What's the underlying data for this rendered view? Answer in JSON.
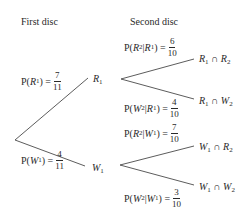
{
  "headers": {
    "first": "First disc",
    "second": "Second disc"
  },
  "first_stage": {
    "r1": {
      "node_label": "R",
      "node_sub": "1",
      "prob_prefix": "P(",
      "prob_event": "R",
      "prob_sub": "1",
      "prob_suffix": ") =",
      "num": "7",
      "den": "11"
    },
    "w1": {
      "node_label": "W",
      "node_sub": "1",
      "prob_prefix": "P(",
      "prob_event": "W",
      "prob_sub": "1",
      "prob_suffix": ") =",
      "num": "4",
      "den": "11"
    }
  },
  "second_stage": {
    "r2_given_r1": {
      "prob_text_a": "P(",
      "ev_a": "R",
      "sub_a": "2",
      "bar": " | ",
      "ev_b": "R",
      "sub_b": "1",
      "prob_text_b": ") =",
      "num": "6",
      "den": "10",
      "outcome_a": "R",
      "outcome_a_sub": "1",
      "cap": " ∩ ",
      "outcome_b": "R",
      "outcome_b_sub": "2"
    },
    "w2_given_r1": {
      "prob_text_a": "P(",
      "ev_a": "W",
      "sub_a": "2",
      "bar": " | ",
      "ev_b": "R",
      "sub_b": "1",
      "prob_text_b": ") =",
      "num": "4",
      "den": "10",
      "outcome_a": "R",
      "outcome_a_sub": "1",
      "cap": " ∩ ",
      "outcome_b": "W",
      "outcome_b_sub": "2"
    },
    "r2_given_w1": {
      "prob_text_a": "P(",
      "ev_a": "R",
      "sub_a": "2",
      "bar": " | ",
      "ev_b": "W",
      "sub_b": "1",
      "prob_text_b": ") =",
      "num": "7",
      "den": "10",
      "outcome_a": "W",
      "outcome_a_sub": "1",
      "cap": " ∩ ",
      "outcome_b": "R",
      "outcome_b_sub": "2"
    },
    "w2_given_w1": {
      "prob_text_a": "P(",
      "ev_a": "W",
      "sub_a": "2",
      "bar": " | ",
      "ev_b": "W",
      "sub_b": "1",
      "prob_text_b": ") =",
      "num": "3",
      "den": "10",
      "outcome_a": "W",
      "outcome_a_sub": "1",
      "cap": " ∩ ",
      "outcome_b": "W",
      "outcome_b_sub": "2"
    }
  },
  "colors": {
    "line": "#4a4a4a",
    "text": "#2a2a2a",
    "background": "#ffffff"
  }
}
